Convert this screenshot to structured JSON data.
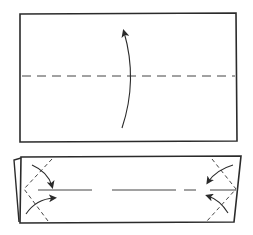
{
  "diagram": {
    "type": "origami-instruction",
    "steps": [
      {
        "id": "step-1",
        "description": "Fold the rectangle in half upward along the horizontal valley fold line",
        "shape": "rectangle",
        "fold_line": "horizontal-dashed-center",
        "arrow": "curved-up"
      },
      {
        "id": "step-2",
        "description": "Fold the four corners in toward the center line",
        "shape": "folded-strip",
        "fold_lines": [
          "diagonal-left-top",
          "diagonal-left-bottom",
          "diagonal-right-top",
          "diagonal-right-bottom"
        ],
        "arrows": [
          "left-top-in",
          "left-bottom-in",
          "right-top-in",
          "right-bottom-in"
        ]
      }
    ],
    "colors": {
      "line": "#2b2b2b",
      "background": "#ffffff"
    }
  }
}
